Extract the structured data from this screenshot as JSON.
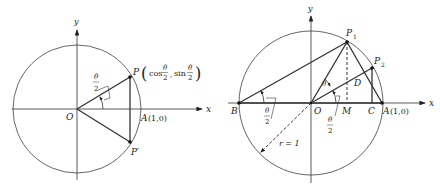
{
  "left_figure": {
    "axis_x_label": "x",
    "axis_y_label": "y",
    "origin_label": "O",
    "point_p_label": "P",
    "point_p_coords": "(cos θ/2, sin θ/2)",
    "coord_cos": "cos",
    "coord_sin": "sin",
    "theta": "θ",
    "two": "2",
    "point_p_prime_label": "P′",
    "point_a_label": "A",
    "point_a_coords": "(1,0)",
    "angle_label": "θ/2"
  },
  "right_figure": {
    "axis_x_label": "x",
    "axis_y_label": "y",
    "origin_label": "O",
    "point_b_label": "B",
    "point_p1_label": "P",
    "point_p1_sub": "1",
    "point_p2_label": "P",
    "point_p2_sub": "2",
    "point_d_label": "D",
    "point_m_label": "M",
    "point_c_label": "C",
    "point_a_label": "A",
    "point_a_coords": "(1,0)",
    "angle_theta_label": "θ",
    "angle_half_theta_at_b": "θ/2",
    "angle_half_theta_at_o": "θ/2",
    "theta": "θ",
    "two": "2",
    "radius_label": "r = 1"
  },
  "colors": {
    "line": "#333333",
    "circle": "#555555",
    "background": "#ffffff"
  }
}
